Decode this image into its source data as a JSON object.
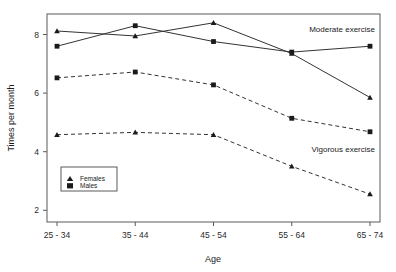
{
  "chart_data": {
    "type": "line",
    "title": "",
    "xlabel": "Age",
    "ylabel": "Times per month",
    "categories": [
      "25 - 34",
      "35 - 44",
      "45 - 54",
      "55 - 64",
      "65 - 74"
    ],
    "ylim": [
      1.6,
      8.7
    ],
    "yticks": [
      2,
      4,
      6,
      8
    ],
    "ytick_labels": [
      "2",
      "4",
      "6",
      "8"
    ],
    "grid": false,
    "legend_position": "lower-left-inside",
    "legend": [
      {
        "label": "Females",
        "marker": "triangle"
      },
      {
        "label": "Males",
        "marker": "square"
      }
    ],
    "annotations": [
      {
        "text": "Moderate exercise",
        "x_category": "65 - 74",
        "y": 8.05
      },
      {
        "text": "Vigorous exercise",
        "x_category": "65 - 74",
        "y": 3.95
      }
    ],
    "series": [
      {
        "name": "Moderate exercise - Females",
        "group": "Moderate exercise",
        "sex": "Females",
        "marker": "triangle",
        "linestyle": "solid",
        "values": [
          8.12,
          7.95,
          8.4,
          7.35,
          5.85
        ]
      },
      {
        "name": "Moderate exercise - Males",
        "group": "Moderate exercise",
        "sex": "Males",
        "marker": "square",
        "linestyle": "solid",
        "values": [
          7.6,
          8.3,
          7.76,
          7.4,
          7.6
        ]
      },
      {
        "name": "Vigorous exercise - Males",
        "group": "Vigorous exercise",
        "sex": "Males",
        "marker": "square",
        "linestyle": "dashed",
        "values": [
          6.52,
          6.72,
          6.28,
          5.14,
          4.68
        ]
      },
      {
        "name": "Vigorous exercise - Females",
        "group": "Vigorous exercise",
        "sex": "Females",
        "marker": "triangle",
        "linestyle": "dashed",
        "values": [
          4.58,
          4.66,
          4.58,
          3.5,
          2.55
        ]
      }
    ]
  },
  "axis": {
    "y_title": "Times per month",
    "x_title": "Age",
    "ytick_0": "2",
    "ytick_1": "4",
    "ytick_2": "6",
    "ytick_3": "8",
    "xtick_0": "25 - 34",
    "xtick_1": "35 - 44",
    "xtick_2": "45 - 54",
    "xtick_3": "55 - 64",
    "xtick_4": "65 - 74"
  },
  "legend": {
    "females_label": "Females",
    "males_label": "Males"
  },
  "annotations": {
    "moderate": "Moderate exercise",
    "vigorous": "Vigorous exercise"
  },
  "colors": {
    "line": "#333333",
    "marker": "#1a1a1a",
    "axis": "#5a5a5a",
    "text": "#1a1a1a",
    "background": "#ffffff"
  }
}
